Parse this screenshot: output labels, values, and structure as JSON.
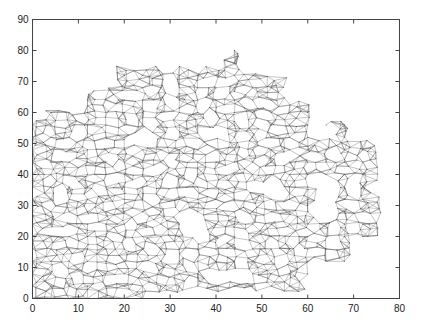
{
  "chart_data": {
    "type": "scatter",
    "subtype": "triangular-mesh",
    "title": "",
    "xlabel": "",
    "ylabel": "",
    "xlim": [
      0,
      80
    ],
    "ylim": [
      0,
      90
    ],
    "xticks": [
      0,
      10,
      20,
      30,
      40,
      50,
      60,
      70,
      80
    ],
    "yticks": [
      0,
      10,
      20,
      30,
      40,
      50,
      60,
      70,
      80,
      90
    ],
    "grid": false,
    "legend": null,
    "edge_color": "#6a6a6a",
    "mesh_region": {
      "description": "Irregular 2D domain covered by a dense triangulation",
      "outline": [
        [
          0,
          2
        ],
        [
          0,
          58
        ],
        [
          2,
          58
        ],
        [
          2,
          61
        ],
        [
          12,
          61
        ],
        [
          12,
          68
        ],
        [
          18,
          68
        ],
        [
          18,
          75
        ],
        [
          40,
          75
        ],
        [
          42,
          80
        ],
        [
          46,
          82
        ],
        [
          46,
          75
        ],
        [
          50,
          75
        ],
        [
          50,
          72
        ],
        [
          56,
          72
        ],
        [
          56,
          64
        ],
        [
          62,
          64
        ],
        [
          62,
          58
        ],
        [
          70,
          58
        ],
        [
          70,
          52
        ],
        [
          76,
          52
        ],
        [
          76,
          20
        ],
        [
          70,
          20
        ],
        [
          70,
          12
        ],
        [
          60,
          12
        ],
        [
          60,
          2
        ],
        [
          50,
          2
        ],
        [
          50,
          0
        ],
        [
          40,
          0
        ],
        [
          40,
          2
        ],
        [
          26,
          2
        ],
        [
          26,
          0
        ],
        [
          0,
          0
        ]
      ],
      "holes": [
        [
          [
            21,
            50
          ],
          [
            27,
            50
          ],
          [
            27,
            53
          ],
          [
            24,
            53
          ],
          [
            21,
            52
          ]
        ],
        [
          [
            36,
            52
          ],
          [
            42,
            52
          ],
          [
            42,
            55
          ],
          [
            38,
            55
          ],
          [
            36,
            54
          ]
        ],
        [
          [
            61,
            52
          ],
          [
            66,
            52
          ],
          [
            66,
            55
          ],
          [
            63,
            55
          ],
          [
            63,
            58
          ],
          [
            61,
            58
          ]
        ],
        [
          [
            48,
            34
          ],
          [
            54,
            34
          ],
          [
            54,
            37
          ],
          [
            48,
            37
          ]
        ],
        [
          [
            62,
            26
          ],
          [
            65,
            26
          ],
          [
            65,
            40
          ],
          [
            62,
            40
          ]
        ],
        [
          [
            33,
            20
          ],
          [
            37,
            20
          ],
          [
            37,
            27
          ],
          [
            33,
            27
          ]
        ],
        [
          [
            40,
            6
          ],
          [
            47,
            6
          ],
          [
            47,
            9
          ],
          [
            40,
            9
          ]
        ],
        [
          [
            37,
            0
          ],
          [
            50,
            0
          ],
          [
            50,
            2
          ],
          [
            37,
            2
          ]
        ]
      ]
    }
  }
}
